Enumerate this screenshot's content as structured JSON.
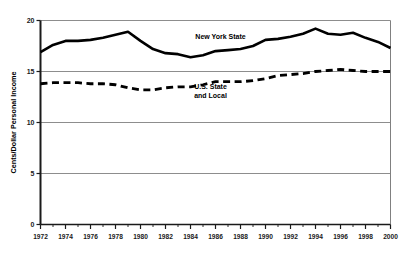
{
  "chart_data": {
    "type": "line",
    "title": "",
    "xlabel": "",
    "ylabel": "Cents/Dollar Personal Income",
    "xlim": [
      1972,
      2000
    ],
    "ylim": [
      0,
      20
    ],
    "yticks": [
      0,
      5,
      10,
      15,
      20
    ],
    "ytick_labels": [
      "0",
      "5",
      "10",
      "15",
      "20"
    ],
    "xticks": [
      1972,
      1974,
      1976,
      1978,
      1980,
      1982,
      1984,
      1986,
      1988,
      1990,
      1992,
      1994,
      1996,
      1998,
      2000
    ],
    "xtick_labels": [
      "1972",
      "1974",
      "1976",
      "1978",
      "1980",
      "1982",
      "1984",
      "1986",
      "1988",
      "1990",
      "1992",
      "1994",
      "1996",
      "1998",
      "2000"
    ],
    "minor_xticks_every": 1,
    "grid": "horizontal",
    "legend_position": "inline-annotations",
    "x": [
      1972,
      1973,
      1974,
      1975,
      1976,
      1977,
      1978,
      1979,
      1980,
      1981,
      1982,
      1983,
      1984,
      1985,
      1986,
      1987,
      1988,
      1989,
      1990,
      1991,
      1992,
      1993,
      1994,
      1995,
      1996,
      1997,
      1998,
      1999,
      2000
    ],
    "series": [
      {
        "name": "New York State",
        "style": "solid",
        "color": "#000000",
        "label_x": 1986.4,
        "label_y": 18.2,
        "values": [
          16.9,
          17.6,
          18.0,
          18.0,
          18.1,
          18.3,
          18.6,
          18.9,
          18.0,
          17.2,
          16.8,
          16.7,
          16.4,
          16.6,
          17.0,
          17.1,
          17.2,
          17.5,
          18.1,
          18.2,
          18.4,
          18.7,
          19.2,
          18.7,
          18.6,
          18.8,
          18.3,
          17.9,
          17.3
        ]
      },
      {
        "name": "U.S. State and Local",
        "name_line1": "U.S. State",
        "name_line2": "and Local",
        "style": "dashed",
        "color": "#000000",
        "label_x": 1985.6,
        "label_y": 13.3,
        "values": [
          13.8,
          13.9,
          13.9,
          13.9,
          13.8,
          13.8,
          13.7,
          13.4,
          13.2,
          13.2,
          13.4,
          13.5,
          13.5,
          13.7,
          14.0,
          14.0,
          14.0,
          14.1,
          14.3,
          14.6,
          14.7,
          14.8,
          15.0,
          15.1,
          15.2,
          15.1,
          15.0,
          15.0,
          15.0
        ]
      }
    ]
  },
  "axes": {
    "y_axis_title": "Cents/Dollar Personal Income"
  }
}
